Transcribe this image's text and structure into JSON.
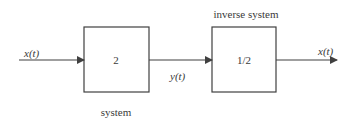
{
  "diagram": {
    "input_signal": {
      "name": "x",
      "arg": "t",
      "label": "x(t)"
    },
    "intermediate_signal": {
      "name": "y",
      "arg": "t",
      "label": "y(t)"
    },
    "output_signal": {
      "name": "x",
      "arg": "t",
      "label": "x(t)"
    },
    "blocks": [
      {
        "id": "system",
        "gain": "2",
        "caption": "system"
      },
      {
        "id": "inverse-system",
        "gain": "1/2",
        "caption": "inverse system"
      }
    ],
    "colors": {
      "stroke": "#404040",
      "text": "#3a3a3a",
      "background": "#ffffff"
    }
  }
}
